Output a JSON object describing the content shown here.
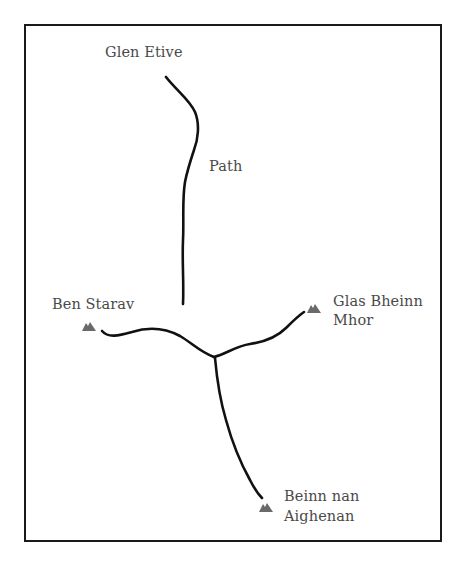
{
  "map": {
    "labels": {
      "start": "Glen Etive",
      "path": "Path",
      "peak_west": "Ben Starav",
      "peak_east_line1": "Glas Bheinn",
      "peak_east_line2": "Mhor",
      "peak_south_line1": "Beinn nan",
      "peak_south_line2": "Aighenan"
    },
    "peaks": [
      {
        "name": "Ben Starav",
        "icon": "mountain-icon"
      },
      {
        "name": "Glas Bheinn Mhor",
        "icon": "mountain-icon"
      },
      {
        "name": "Beinn nan Aighenan",
        "icon": "mountain-icon"
      }
    ],
    "colors": {
      "route": "#111111",
      "frame": "#1a1a1a",
      "text": "#4a4a4a",
      "peak": "#6a6a6a"
    }
  }
}
